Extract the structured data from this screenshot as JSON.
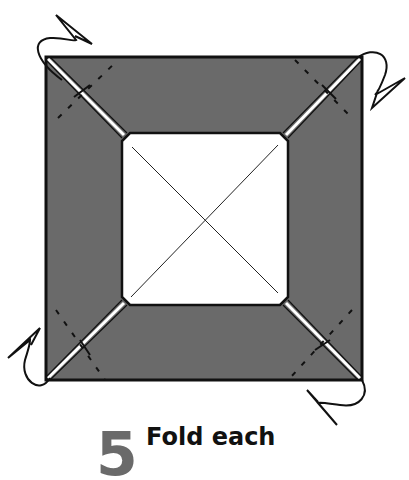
{
  "diagram": {
    "colors": {
      "paper_colored": "#6a6a6a",
      "paper_white": "#ffffff",
      "line": "#111111",
      "step_number": "#6a6a6a"
    },
    "outer_square": {
      "x1": 46,
      "y1": 57,
      "x2": 362,
      "y2": 380
    },
    "inner_square": {
      "x1": 122,
      "y1": 133,
      "x2": 288,
      "y2": 305
    },
    "corners": [
      "top-left",
      "top-right",
      "bottom-left",
      "bottom-right"
    ],
    "symbols": [
      "mountain-fold-lines",
      "valley-fold-diagonals",
      "fold-behind-arrows",
      "crease-cross-marks"
    ]
  },
  "instruction": {
    "step_number": "5",
    "text": "Fold each"
  }
}
